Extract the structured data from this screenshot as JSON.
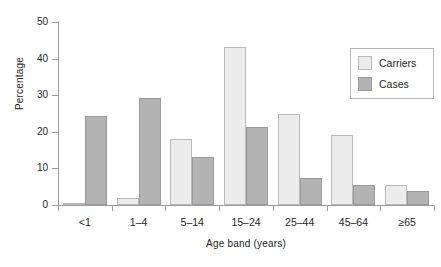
{
  "chart_data": {
    "type": "bar",
    "title": "",
    "xlabel": "Age band (years)",
    "ylabel": "Percentage",
    "categories": [
      "<1",
      "1–4",
      "5–14",
      "15–24",
      "25–44",
      "45–64",
      "≥65"
    ],
    "series": [
      {
        "name": "Carriers",
        "color": "#ececec",
        "values": [
          0.3,
          1.8,
          18.0,
          43.2,
          24.9,
          19.1,
          5.6
        ]
      },
      {
        "name": "Cases",
        "color": "#b3b3b3",
        "values": [
          24.3,
          29.2,
          13.2,
          21.2,
          7.4,
          5.4,
          3.7
        ]
      }
    ],
    "ylim": [
      0,
      50
    ],
    "yticks": [
      0,
      10,
      20,
      30,
      40,
      50
    ],
    "ytick_labels": [
      "0",
      "10",
      "20",
      "30",
      "40",
      "50"
    ],
    "grid": false,
    "legend_position": "top-right"
  },
  "legend": {
    "entries": [
      {
        "label": "Carriers"
      },
      {
        "label": "Cases"
      }
    ]
  }
}
